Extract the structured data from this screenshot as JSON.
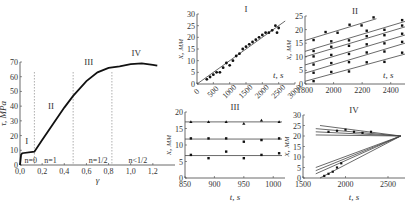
{
  "chart_data": [
    {
      "id": "main",
      "type": "line",
      "title": "",
      "xlabel": "γ",
      "ylabel": "τ, MPa",
      "xlim": [
        0,
        1.4
      ],
      "ylim": [
        0,
        70
      ],
      "xticks": [
        "0,0",
        "0,2",
        "0,4",
        "0,6",
        "0,8",
        "1,0",
        "1,2"
      ],
      "yticks": [
        "0",
        "10",
        "20",
        "30",
        "40",
        "50",
        "60",
        "70"
      ],
      "series": [
        {
          "name": "stress-strain",
          "x": [
            0,
            0.01,
            0.02,
            0.13,
            0.2,
            0.3,
            0.4,
            0.48,
            0.6,
            0.7,
            0.8,
            0.9,
            1.0,
            1.1,
            1.2,
            1.24
          ],
          "y": [
            0,
            7,
            8,
            9,
            17,
            28,
            39,
            47,
            57,
            63,
            66,
            67,
            68.5,
            69,
            68,
            67.5
          ]
        }
      ],
      "stage_labels": [
        "I",
        "II",
        "III",
        "IV"
      ],
      "stage_boundaries": [
        0.13,
        0.48,
        0.83
      ],
      "annotations": [
        "n=0",
        "n=1",
        "n=1/2",
        "n<1/2"
      ]
    },
    {
      "id": "I",
      "type": "scatter",
      "title": "I",
      "xlabel": "t, s",
      "ylabel": "x, мм",
      "xlim": [
        0,
        3000
      ],
      "ylim": [
        0,
        30
      ],
      "xticks": [
        "0",
        "500",
        "1000",
        "1500",
        "2000",
        "2500",
        "3000"
      ],
      "yticks": [
        "0",
        "5",
        "10",
        "15",
        "20",
        "25",
        "30"
      ],
      "fit_line": {
        "x": [
          0,
          2700
        ],
        "y": [
          0,
          27
        ]
      },
      "points_approx": [
        [
          300,
          2
        ],
        [
          400,
          3
        ],
        [
          500,
          4
        ],
        [
          600,
          5
        ],
        [
          700,
          5
        ],
        [
          800,
          7
        ],
        [
          900,
          9
        ],
        [
          1000,
          8
        ],
        [
          1100,
          10
        ],
        [
          1200,
          12
        ],
        [
          1300,
          13
        ],
        [
          1400,
          15
        ],
        [
          1500,
          16
        ],
        [
          1600,
          17
        ],
        [
          1700,
          18
        ],
        [
          1800,
          19
        ],
        [
          1900,
          20
        ],
        [
          2000,
          21
        ],
        [
          2100,
          22
        ],
        [
          2200,
          22
        ],
        [
          2300,
          23
        ],
        [
          2400,
          25
        ],
        [
          2450,
          22
        ],
        [
          2500,
          24
        ]
      ]
    },
    {
      "id": "II",
      "type": "scatter",
      "title": "II",
      "xlabel": "t, s",
      "ylabel": "x, мм",
      "xlim": [
        1800,
        2500
      ],
      "ylim": [
        0,
        25
      ],
      "xticks": [
        "1800",
        "2000",
        "2200",
        "2400"
      ],
      "yticks": [
        "0",
        "5",
        "10",
        "15",
        "20",
        "25"
      ],
      "fit_lines": [
        {
          "x": [
            1800,
            2500
          ],
          "y": [
            1,
            11
          ]
        },
        {
          "x": [
            1800,
            2500
          ],
          "y": [
            4,
            15
          ]
        },
        {
          "x": [
            1800,
            2500
          ],
          "y": [
            7,
            18
          ]
        },
        {
          "x": [
            1800,
            2500
          ],
          "y": [
            10,
            21
          ]
        },
        {
          "x": [
            1800,
            2500
          ],
          "y": [
            12,
            23
          ]
        },
        {
          "x": [
            1800,
            2300
          ],
          "y": [
            16,
            24
          ]
        }
      ]
    },
    {
      "id": "III",
      "type": "scatter",
      "title": "III",
      "xlabel": "t, s",
      "ylabel": "x, мм",
      "xlim": [
        850,
        1020
      ],
      "ylim": [
        0,
        20
      ],
      "xticks": [
        "850",
        "900",
        "950",
        "1000"
      ],
      "yticks": [
        "0",
        "5",
        "10",
        "15",
        "20"
      ],
      "series": [
        {
          "name": "upper",
          "x": [
            860,
            890,
            920,
            950,
            980,
            1010
          ],
          "y": [
            17,
            17,
            17,
            16.5,
            17.5,
            17
          ]
        },
        {
          "name": "middle",
          "x": [
            860,
            890,
            920,
            950,
            980,
            1010
          ],
          "y": [
            12,
            12,
            12,
            11,
            11.5,
            12
          ]
        },
        {
          "name": "lower",
          "x": [
            860,
            890,
            920,
            950,
            980,
            1010
          ],
          "y": [
            7,
            6,
            8,
            6,
            7,
            7.5
          ]
        }
      ],
      "fit_lines": [
        {
          "y": 17
        },
        {
          "y": 11.8
        },
        {
          "y": 6.8
        }
      ]
    },
    {
      "id": "IV",
      "type": "scatter",
      "title": "IV",
      "xlabel": "t, s",
      "ylabel": "x, мм",
      "xlim": [
        1500,
        2700
      ],
      "ylim": [
        0,
        30
      ],
      "xticks": [
        "1500",
        "2000",
        "2500"
      ],
      "yticks": [
        "0",
        "5",
        "10",
        "15",
        "20",
        "25",
        "30"
      ],
      "convergence_point": [
        2600,
        20
      ],
      "fit_lines": [
        {
          "x": [
            1700,
            2650
          ],
          "y": [
            25,
            20
          ]
        },
        {
          "x": [
            1650,
            2650
          ],
          "y": [
            23.5,
            20
          ]
        },
        {
          "x": [
            1650,
            2650
          ],
          "y": [
            22,
            20
          ]
        },
        {
          "x": [
            1650,
            2650
          ],
          "y": [
            20.5,
            20
          ]
        },
        {
          "x": [
            1650,
            2650
          ],
          "y": [
            5,
            20
          ]
        },
        {
          "x": [
            1650,
            2650
          ],
          "y": [
            3.5,
            20
          ]
        },
        {
          "x": [
            1650,
            2650
          ],
          "y": [
            2,
            20
          ]
        },
        {
          "x": [
            1700,
            2650
          ],
          "y": [
            0,
            20
          ]
        }
      ]
    }
  ]
}
